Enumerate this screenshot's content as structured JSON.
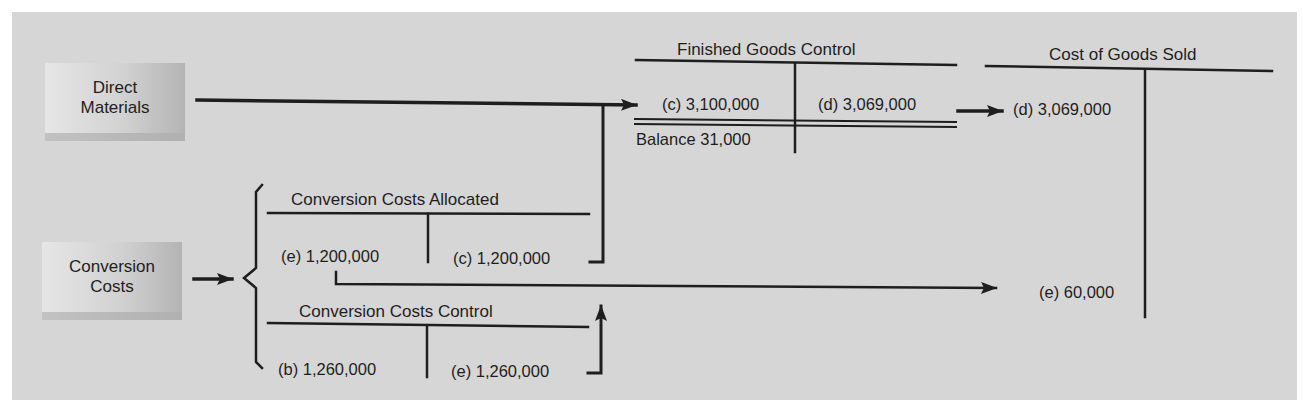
{
  "diagram": {
    "sources": {
      "direct_materials": {
        "line1": "Direct",
        "line2": "Materials"
      },
      "conversion_costs": {
        "line1": "Conversion",
        "line2": "Costs"
      }
    },
    "accounts": {
      "conversion_costs_allocated": {
        "title": "Conversion Costs Allocated",
        "debit": "(e) 1,200,000",
        "credit": "(c) 1,200,000"
      },
      "conversion_costs_control": {
        "title": "Conversion Costs Control",
        "debit": "(b) 1,260,000",
        "credit": "(e) 1,260,000"
      },
      "finished_goods_control": {
        "title": "Finished Goods Control",
        "debit": "(c) 3,100,000",
        "credit": "(d) 3,069,000",
        "balance": "Balance 31,000"
      },
      "cost_of_goods_sold": {
        "title": "Cost of Goods Sold",
        "debit_1": "(d) 3,069,000",
        "debit_2": "(e) 60,000"
      }
    },
    "colors": {
      "background": "#d6d6d6",
      "ink": "#1e1e1e",
      "box_light": "#e6e6e6",
      "box_dark": "#b4b4b4"
    }
  }
}
